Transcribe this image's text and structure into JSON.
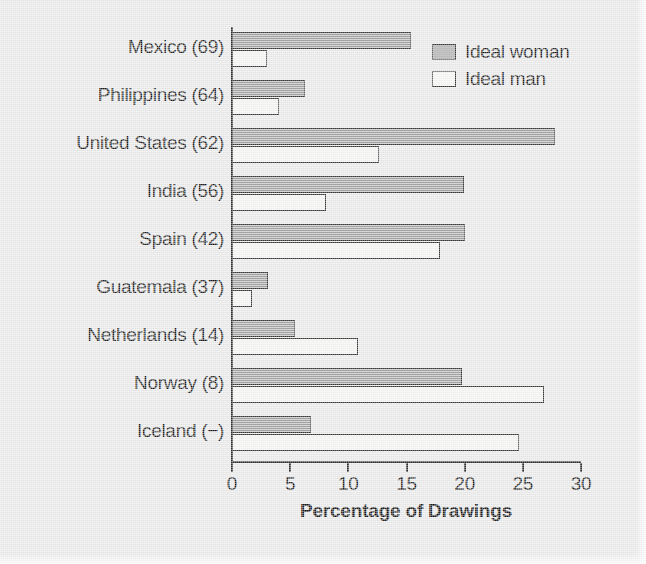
{
  "chart_data": {
    "type": "bar",
    "orientation": "horizontal",
    "title": "",
    "xlabel": "Percentage of Drawings",
    "ylabel": "",
    "xlim": [
      0,
      30
    ],
    "xticks": [
      0,
      5,
      10,
      15,
      20,
      25,
      30
    ],
    "xtick_labels": [
      "0",
      "5",
      "10",
      "15",
      "20",
      "25",
      "30"
    ],
    "grid": false,
    "legend_position": "top-right",
    "categories": [
      "Mexico (69)",
      "Philippines (64)",
      "United States (62)",
      "India (56)",
      "Spain (42)",
      "Guatemala (37)",
      "Netherlands (14)",
      "Norway (8)",
      "Iceland (−)"
    ],
    "series": [
      {
        "name": "Ideal woman",
        "color": "#9a9a9a",
        "values": [
          15.4,
          6.3,
          27.8,
          19.9,
          20.0,
          3.1,
          5.4,
          19.8,
          6.8
        ]
      },
      {
        "name": "Ideal man",
        "color": "#f4f4f2",
        "values": [
          3.0,
          4.0,
          12.6,
          8.1,
          17.9,
          1.7,
          10.8,
          26.8,
          24.7
        ]
      }
    ]
  },
  "legend": {
    "entries": [
      {
        "label": "Ideal woman",
        "swatch": "woman"
      },
      {
        "label": "Ideal man",
        "swatch": "man"
      }
    ]
  }
}
